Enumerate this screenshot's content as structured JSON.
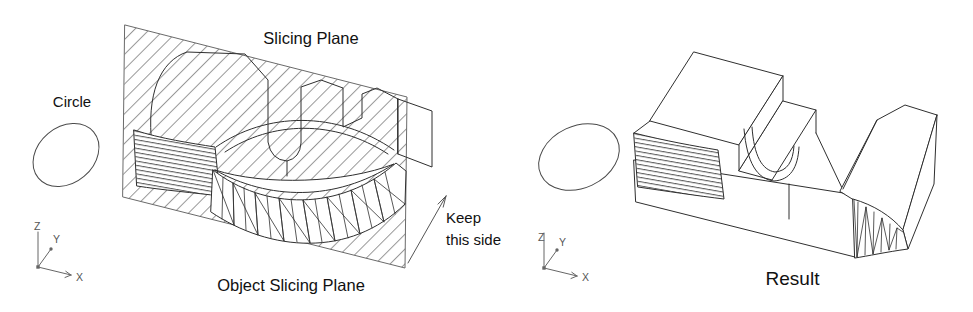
{
  "figure": {
    "left": {
      "circle_label": "Circle",
      "slicing_plane_label": "Slicing Plane",
      "object_label": "Object Slicing Plane",
      "keep_label": "Keep this side",
      "ucs": {
        "x": "X",
        "y": "Y",
        "z": "Z"
      }
    },
    "right": {
      "result_label": "Result",
      "ucs": {
        "x": "X",
        "y": "Y",
        "z": "Z"
      }
    }
  },
  "icons": {
    "left_axes": "ucs-triad-icon",
    "right_axes": "ucs-triad-icon",
    "keep_direction": "direction-arrow-icon"
  },
  "colors": {
    "background": "#ffffff",
    "line": "#2f2f2f",
    "hatch": "#979797",
    "text": "#111111"
  }
}
